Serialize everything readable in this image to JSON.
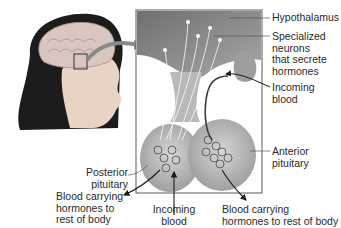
{
  "labels": {
    "hypothalamus": "Hypothalamus",
    "specialized_neurons": [
      "Specialized",
      "neurons",
      "that secrete",
      "hormones"
    ],
    "incoming_blood_right": [
      "Incoming",
      "blood"
    ],
    "anterior_pituitary": [
      "Anterior",
      "pituitary"
    ],
    "posterior_pituitary": [
      "Posterior",
      "pituitary"
    ],
    "blood_carrying_left": [
      "Blood carrying",
      "hormones to",
      "rest of body"
    ],
    "incoming_blood_bottom": [
      "Incoming",
      "blood"
    ],
    "blood_carrying_right": [
      "Blood carrying",
      "hormones to rest of body"
    ]
  },
  "colors": {
    "skin": "#e9d3c4",
    "hair": "#1c1c1c",
    "brain": "#d9c6c0",
    "gland": "#b9b9b9",
    "hypothalamus_fill": "#8c8c8c",
    "box_border": "#5a5a5a",
    "arrow": "#7a7a7a"
  }
}
